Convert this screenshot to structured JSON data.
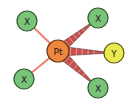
{
  "diagram": {
    "type": "molecular-structure",
    "center": {
      "label": "Pt",
      "x": 58,
      "y": 51,
      "r": 11,
      "fill": "#f0873f",
      "stroke": "#6b3a1a"
    },
    "ligands": [
      {
        "label": "X",
        "x": 27,
        "y": 21,
        "r": 10,
        "fill": "#7ac47a",
        "stroke": "#2f5a2f",
        "bond": "plain"
      },
      {
        "label": "X",
        "x": 98,
        "y": 18,
        "r": 10,
        "fill": "#7ac47a",
        "stroke": "#2f5a2f",
        "bond": "wedge-hashed"
      },
      {
        "label": "Y",
        "x": 114,
        "y": 53,
        "r": 10,
        "fill": "#eaea50",
        "stroke": "#5a5a1a",
        "bond": "wedge-hashed"
      },
      {
        "label": "X",
        "x": 98,
        "y": 88,
        "r": 10,
        "fill": "#7ac47a",
        "stroke": "#2f5a2f",
        "bond": "wedge-hashed"
      },
      {
        "label": "X",
        "x": 24,
        "y": 79,
        "r": 10,
        "fill": "#7ac47a",
        "stroke": "#2f5a2f",
        "bond": "plain"
      }
    ],
    "bond_color": "#f08070",
    "wedge_fill": "#c85050",
    "wedge_dark": "#3a2a2a"
  }
}
